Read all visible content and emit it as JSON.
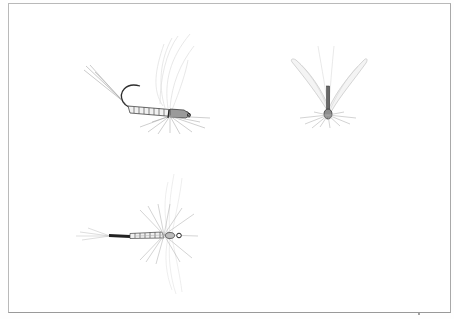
{
  "illustration": {
    "subject": "fishing flies drawing",
    "background_color": "#ffffff",
    "frame_color": "#b0b0b0",
    "ink_color": "#3a3a3a",
    "hackle_color": "#b8b8b8",
    "wing_color": "#d8d8d8",
    "flies": [
      {
        "name": "side-view-hooked-fly",
        "view": "side",
        "has_hook": true
      },
      {
        "name": "front-view-winged-fly",
        "view": "front",
        "has_hook": false
      },
      {
        "name": "top-view-spinner-fly",
        "view": "top",
        "has_hook": false
      }
    ]
  }
}
